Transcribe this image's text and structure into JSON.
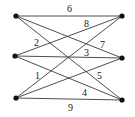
{
  "diagram": {
    "type": "weighted-bipartite-graph",
    "nodes": [
      {
        "id": "L1",
        "x": 16,
        "y": 16
      },
      {
        "id": "L2",
        "x": 15,
        "y": 56
      },
      {
        "id": "L3",
        "x": 16,
        "y": 98
      },
      {
        "id": "R1",
        "x": 122,
        "y": 16
      },
      {
        "id": "R2",
        "x": 122,
        "y": 58
      },
      {
        "id": "R3",
        "x": 122,
        "y": 100
      }
    ],
    "edges": [
      {
        "from": "L1",
        "to": "R1",
        "weight": "6",
        "lx": 70,
        "ly": 12
      },
      {
        "from": "L2",
        "to": "R1",
        "weight": "8",
        "lx": 87,
        "ly": 26
      },
      {
        "from": "L1",
        "to": "R3",
        "weight": "2",
        "lx": 37,
        "ly": 45
      },
      {
        "from": "L1",
        "to": "R2",
        "weight": "7",
        "lx": 103,
        "ly": 47
      },
      {
        "from": "L2",
        "to": "R2",
        "weight": "3",
        "lx": 87,
        "ly": 55
      },
      {
        "from": "L3",
        "to": "R1",
        "weight": "1",
        "lx": 37,
        "ly": 78
      },
      {
        "from": "L3",
        "to": "R2",
        "weight": "5",
        "lx": 100,
        "ly": 78
      },
      {
        "from": "L2",
        "to": "R3",
        "weight": "4",
        "lx": 85,
        "ly": 95
      },
      {
        "from": "L3",
        "to": "R3",
        "weight": "9",
        "lx": 71,
        "ly": 110
      }
    ],
    "colors": {
      "edge": "#3a3a3a",
      "node": "#111111",
      "label": "#222222",
      "background": "#ffffff"
    }
  }
}
